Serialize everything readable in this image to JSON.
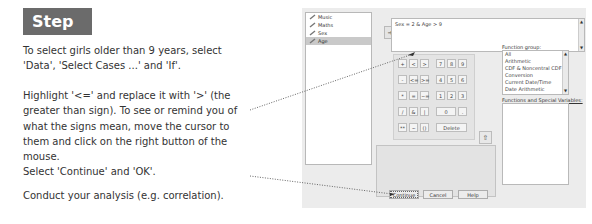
{
  "instructions": {
    "step_label": "Step 3d:",
    "paragraphs": [
      "To select girls older than 9 years, select 'Data', 'Select Cases ...'  and 'If'.",
      "Highlight '<=' and replace it with '>' (the greater than sign). To see or remind you of what the signs mean, move the cursor to them and click on the right button of the mouse.",
      "Select 'Continue' and 'OK'.",
      "Conduct your analysis (e.g. correlation)."
    ]
  },
  "dialog": {
    "variables": [
      {
        "name": "Music",
        "selected": false
      },
      {
        "name": "Maths",
        "selected": false
      },
      {
        "name": "Sex",
        "selected": false
      },
      {
        "name": "Age",
        "selected": true
      }
    ],
    "move_button": "arrow-right-icon",
    "expression": "Sex = 2 & Age > 9",
    "keypad": {
      "keys": [
        [
          "+",
          "<",
          ">",
          "7",
          "8",
          "9"
        ],
        [
          "-",
          "<=",
          ">=",
          "4",
          "5",
          "6"
        ],
        [
          "*",
          "=",
          "~=",
          "1",
          "2",
          "3"
        ],
        [
          "/",
          "&",
          "|",
          "0",
          "."
        ],
        [
          "**",
          "~",
          "()",
          "Delete"
        ]
      ]
    },
    "function_group_label": "Function group:",
    "function_groups": [
      "All",
      "Arithmetic",
      "CDF & Noncentral CDF",
      "Conversion",
      "Current Date/Time",
      "Date Arithmetic"
    ],
    "functions_label": "Functions and Special Variables:",
    "functions": [],
    "buttons": {
      "continue": "Continue",
      "cancel": "Cancel",
      "help": "Help"
    }
  }
}
